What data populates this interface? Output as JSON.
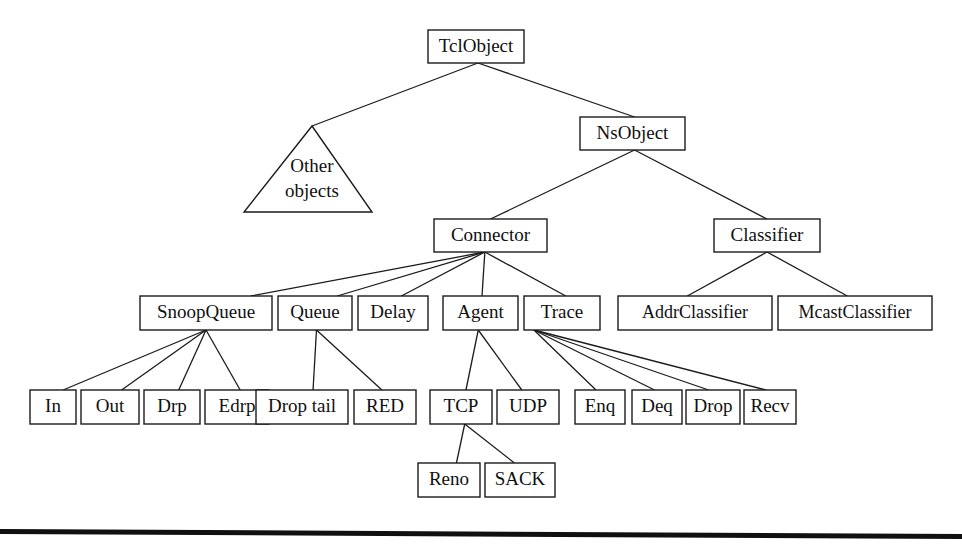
{
  "figure": {
    "kind": "class-hierarchy-diagram",
    "root_label": "TclObject",
    "background_color": "#ffffff",
    "line_color": "#1b1b1b",
    "text_color": "#101010"
  },
  "nodes": {
    "tclobject": {
      "label": "TclObject",
      "x": 428,
      "y": 30,
      "w": 96,
      "h": 33
    },
    "nsobject": {
      "label": "NsObject",
      "x": 580,
      "y": 117,
      "w": 105,
      "h": 33
    },
    "other_objects": {
      "label_line1": "Other",
      "label_line2": "objects",
      "apex_x": 312,
      "apex_y": 126,
      "base_left_x": 244,
      "base_right_x": 372,
      "base_y": 212
    },
    "connector": {
      "label": "Connector",
      "x": 434,
      "y": 219,
      "w": 113,
      "h": 33
    },
    "classifier": {
      "label": "Classifier",
      "x": 714,
      "y": 219,
      "w": 106,
      "h": 33
    },
    "snoopqueue": {
      "label": "SnoopQueue",
      "x": 140,
      "y": 296,
      "w": 132,
      "h": 34
    },
    "queue": {
      "label": "Queue",
      "x": 278,
      "y": 296,
      "w": 74,
      "h": 34
    },
    "delay": {
      "label": "Delay",
      "x": 358,
      "y": 296,
      "w": 70,
      "h": 34
    },
    "agent": {
      "label": "Agent",
      "x": 443,
      "y": 296,
      "w": 75,
      "h": 34
    },
    "trace": {
      "label": "Trace",
      "x": 524,
      "y": 296,
      "w": 76,
      "h": 34
    },
    "addrclassifier": {
      "label": "AddrClassifier",
      "x": 618,
      "y": 296,
      "w": 154,
      "h": 34
    },
    "mcastclassifier": {
      "label": "McastClassifier",
      "x": 778,
      "y": 296,
      "w": 154,
      "h": 34
    },
    "in": {
      "label": "In",
      "x": 30,
      "y": 390,
      "w": 46,
      "h": 34
    },
    "out": {
      "label": "Out",
      "x": 81,
      "y": 390,
      "w": 58,
      "h": 34
    },
    "drp": {
      "label": "Drp",
      "x": 144,
      "y": 390,
      "w": 56,
      "h": 34
    },
    "edrp": {
      "label": "Edrp",
      "x": 205,
      "y": 390,
      "w": 64,
      "h": 34
    },
    "droptail": {
      "label": "Drop tail",
      "x": 256,
      "y": 390,
      "w": 92,
      "h": 34
    },
    "red": {
      "label": "RED",
      "x": 354,
      "y": 390,
      "w": 62,
      "h": 34
    },
    "tcp": {
      "label": "TCP",
      "x": 430,
      "y": 390,
      "w": 62,
      "h": 34
    },
    "udp": {
      "label": "UDP",
      "x": 497,
      "y": 390,
      "w": 62,
      "h": 34
    },
    "enq": {
      "label": "Enq",
      "x": 575,
      "y": 390,
      "w": 50,
      "h": 34
    },
    "deq": {
      "label": "Deq",
      "x": 632,
      "y": 390,
      "w": 50,
      "h": 34
    },
    "drop": {
      "label": "Drop",
      "x": 686,
      "y": 390,
      "w": 54,
      "h": 34
    },
    "recv": {
      "label": "Recv",
      "x": 744,
      "y": 390,
      "w": 52,
      "h": 34
    },
    "reno": {
      "label": "Reno",
      "x": 418,
      "y": 463,
      "w": 62,
      "h": 34
    },
    "sack": {
      "label": "SACK",
      "x": 485,
      "y": 463,
      "w": 70,
      "h": 34
    }
  },
  "edges": [
    {
      "from": "tclobject",
      "to": "other_objects"
    },
    {
      "from": "tclobject",
      "to": "nsobject"
    },
    {
      "from": "nsobject",
      "to": "connector"
    },
    {
      "from": "nsobject",
      "to": "classifier"
    },
    {
      "from": "connector",
      "to": "snoopqueue"
    },
    {
      "from": "connector",
      "to": "queue"
    },
    {
      "from": "connector",
      "to": "delay"
    },
    {
      "from": "connector",
      "to": "agent"
    },
    {
      "from": "connector",
      "to": "trace"
    },
    {
      "from": "classifier",
      "to": "addrclassifier"
    },
    {
      "from": "classifier",
      "to": "mcastclassifier"
    },
    {
      "from": "snoopqueue",
      "to": "in"
    },
    {
      "from": "snoopqueue",
      "to": "out"
    },
    {
      "from": "snoopqueue",
      "to": "drp"
    },
    {
      "from": "snoopqueue",
      "to": "edrp"
    },
    {
      "from": "queue",
      "to": "droptail"
    },
    {
      "from": "queue",
      "to": "red"
    },
    {
      "from": "agent",
      "to": "tcp"
    },
    {
      "from": "agent",
      "to": "udp"
    },
    {
      "from": "trace",
      "to": "enq"
    },
    {
      "from": "trace",
      "to": "deq"
    },
    {
      "from": "trace",
      "to": "drop"
    },
    {
      "from": "trace",
      "to": "recv"
    },
    {
      "from": "tcp",
      "to": "reno"
    },
    {
      "from": "tcp",
      "to": "sack"
    }
  ],
  "footer_rule": {
    "left_x": 0,
    "right_x": 962,
    "left_y": 529,
    "right_y": 534,
    "thickness": 5
  }
}
